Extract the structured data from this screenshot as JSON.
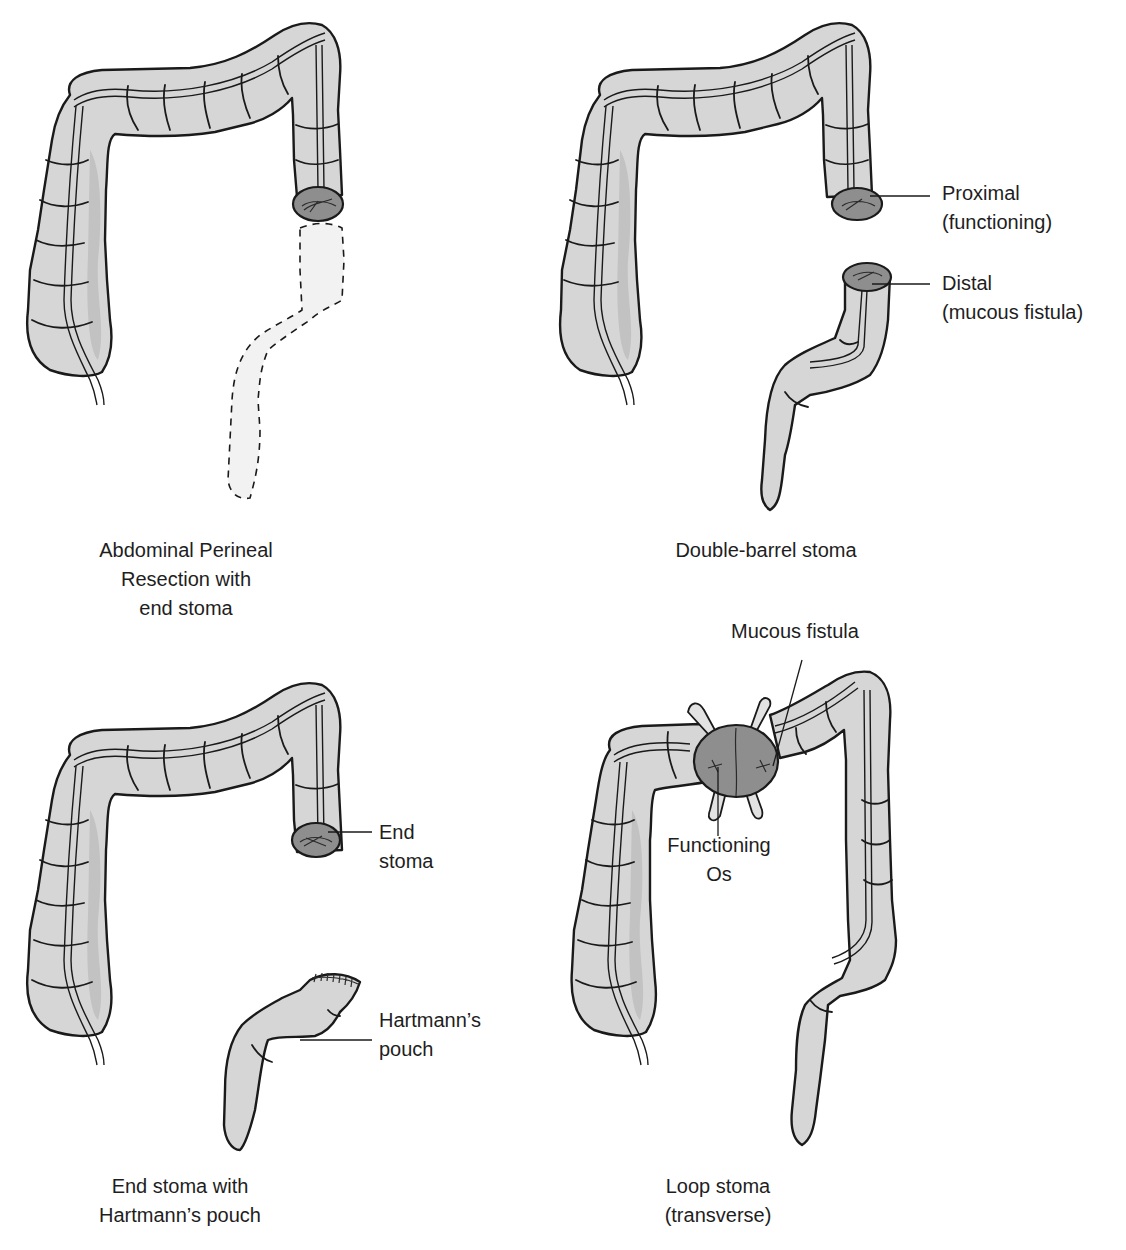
{
  "figure": {
    "colors": {
      "colon_fill": "#d6d6d6",
      "stoma_fill": "#8e8e8e",
      "outline": "#1a1a1a",
      "removed_segment_fill": "#f2f2f2",
      "background": "#ffffff"
    },
    "panels": [
      {
        "id": "abdominal-perineal-resection",
        "caption_lines": [
          "Abdominal Perineal",
          "Resection with",
          "end stoma"
        ],
        "labels": []
      },
      {
        "id": "double-barrel-stoma",
        "caption_lines": [
          "Double-barrel stoma"
        ],
        "labels": [
          {
            "lines": [
              "Proximal",
              "(functioning)"
            ]
          },
          {
            "lines": [
              "Distal",
              "(mucous fistula)"
            ]
          }
        ]
      },
      {
        "id": "end-stoma-hartmanns",
        "caption_lines": [
          "End stoma with",
          "Hartmann’s pouch"
        ],
        "labels": [
          {
            "lines": [
              "End",
              "stoma"
            ]
          },
          {
            "lines": [
              "Hartmann’s",
              "pouch"
            ]
          }
        ]
      },
      {
        "id": "loop-stoma",
        "caption_lines": [
          "Loop stoma",
          "(transverse)"
        ],
        "labels": [
          {
            "lines": [
              "Mucous fistula"
            ]
          },
          {
            "lines": [
              "Functioning",
              "Os"
            ]
          }
        ]
      }
    ]
  }
}
